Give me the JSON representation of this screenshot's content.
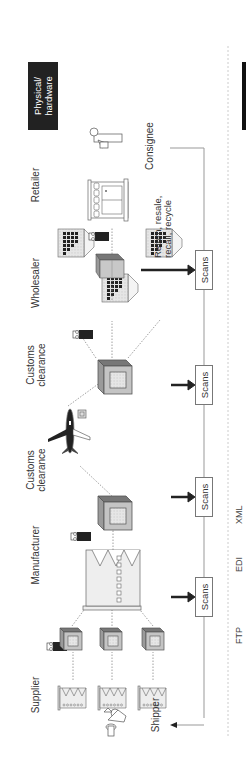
{
  "diagram": {
    "orientation": "rotated -90deg (reads bottom-to-top)",
    "layer_label": "Physical/\nhardware",
    "layer_label_line1": "Physical/",
    "layer_label_line2": "hardware",
    "stages": [
      {
        "id": "supplier",
        "label": "Supplier"
      },
      {
        "id": "manufacturer",
        "label": "Manufacturer"
      },
      {
        "id": "customs1",
        "label_line1": "Customs",
        "label_line2": "clearance"
      },
      {
        "id": "customs2",
        "label_line1": "Customs",
        "label_line2": "clearance"
      },
      {
        "id": "wholesaler",
        "label": "Wholesaler"
      },
      {
        "id": "retailer",
        "label": "Retailer"
      }
    ],
    "endpoints": {
      "shipper": "Shipper",
      "consignee": "Consignee"
    },
    "scans": [
      "Scans",
      "Scans",
      "Scans",
      "Scans"
    ],
    "return_note_line1": "Return, resale,",
    "return_note_line2": "recall, recycle",
    "protocols": [
      "FTP",
      "EDI",
      "XML"
    ],
    "colors": {
      "layer_label_bg": "#222222",
      "line": "#999999",
      "box_face": "#c8c8c8",
      "arrow": "#222222"
    }
  }
}
